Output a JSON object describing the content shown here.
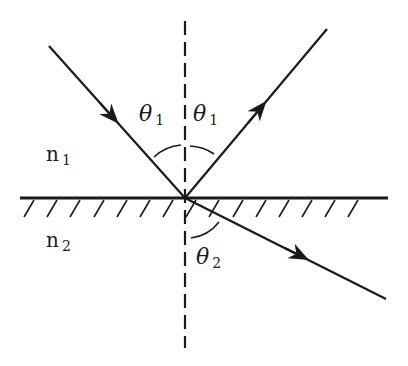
{
  "diagram": {
    "colors": {
      "stroke": "#1a1a1a",
      "background": "#ffffff"
    },
    "labels": {
      "theta_incident": {
        "symbol": "θ",
        "sub": "1"
      },
      "theta_reflected": {
        "symbol": "θ",
        "sub": "1"
      },
      "theta_refracted": {
        "symbol": "θ",
        "sub": "2"
      },
      "medium_top": {
        "symbol": "n",
        "sub": "1"
      },
      "medium_bottom": {
        "symbol": "n",
        "sub": "2"
      }
    },
    "geometry": {
      "interface": {
        "x1": 20,
        "y1": 198,
        "x2": 388,
        "y2": 198
      },
      "normal": {
        "x": 185,
        "y1": 21,
        "y2": 348
      },
      "incident_ray": {
        "x1": 49,
        "y1": 46,
        "x2": 185,
        "y2": 198
      },
      "reflected_ray": {
        "x1": 185,
        "y1": 198,
        "x2": 327,
        "y2": 29
      },
      "refracted_ray": {
        "x1": 185,
        "y1": 198,
        "x2": 386,
        "y2": 299
      }
    }
  }
}
